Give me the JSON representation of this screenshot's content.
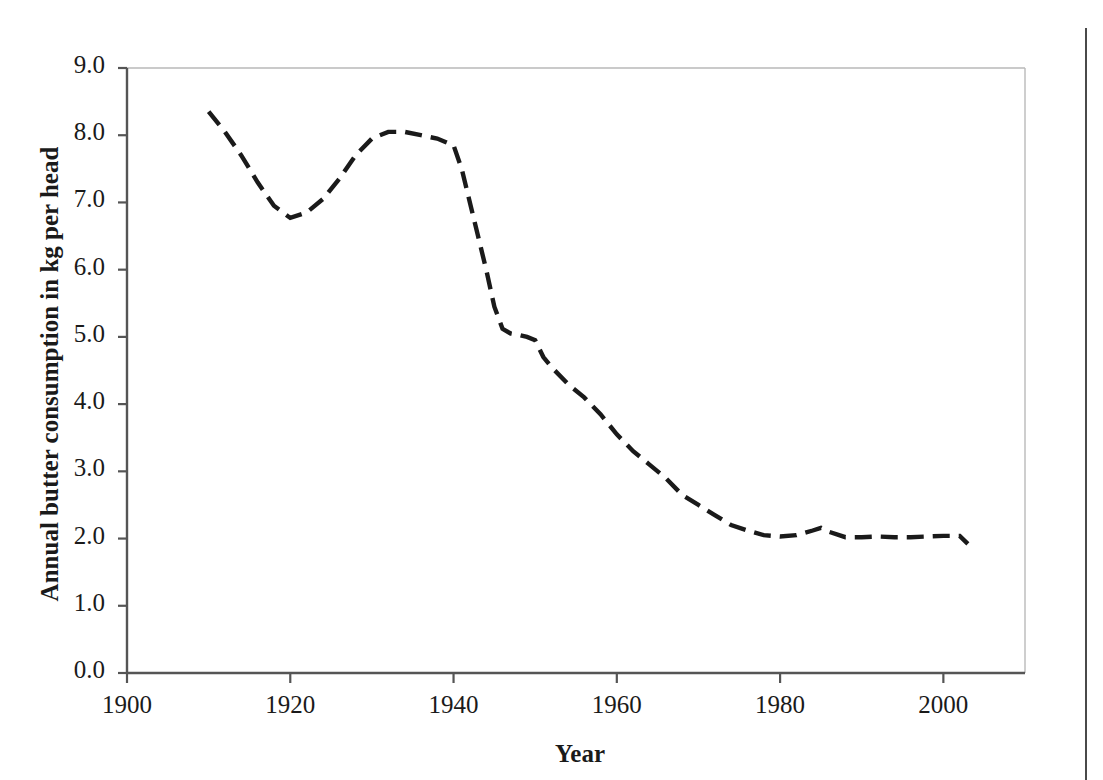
{
  "chart_data": {
    "type": "line",
    "title": "",
    "xlabel": "Year",
    "ylabel": "Annual butter consumption in kg per head",
    "xlim": [
      1900,
      2010
    ],
    "ylim": [
      0.0,
      9.0
    ],
    "grid": false,
    "legend": "none",
    "line_style": "dashed",
    "line_color": "#1a1a1a",
    "x_ticks": [
      1900,
      1920,
      1940,
      1960,
      1980,
      2000
    ],
    "x_tick_labels": [
      "1900",
      "1920",
      "1940",
      "1960",
      "1980",
      "2000"
    ],
    "y_ticks": [
      0.0,
      1.0,
      2.0,
      3.0,
      4.0,
      5.0,
      6.0,
      7.0,
      8.0,
      9.0
    ],
    "y_tick_labels": [
      "0.0",
      "1.0",
      "2.0",
      "3.0",
      "4.0",
      "5.0",
      "6.0",
      "7.0",
      "8.0",
      "9.0"
    ],
    "series": [
      {
        "name": "Annual butter consumption",
        "x": [
          1910,
          1912,
          1914,
          1916,
          1918,
          1920,
          1922,
          1924,
          1926,
          1928,
          1930,
          1932,
          1934,
          1936,
          1938,
          1939,
          1940,
          1941,
          1942,
          1943,
          1944,
          1945,
          1946,
          1947,
          1948,
          1949,
          1950,
          1951,
          1952,
          1954,
          1956,
          1958,
          1960,
          1962,
          1964,
          1966,
          1968,
          1970,
          1972,
          1974,
          1976,
          1978,
          1980,
          1982,
          1984,
          1985,
          1986,
          1988,
          1990,
          1992,
          1994,
          1996,
          1998,
          2000,
          2002,
          2003
        ],
        "y": [
          8.35,
          8.05,
          7.7,
          7.3,
          6.95,
          6.77,
          6.85,
          7.05,
          7.35,
          7.7,
          7.95,
          8.05,
          8.05,
          8.0,
          7.95,
          7.9,
          7.85,
          7.5,
          7.0,
          6.5,
          6.0,
          5.45,
          5.12,
          5.05,
          5.03,
          5.0,
          4.95,
          4.7,
          4.55,
          4.3,
          4.1,
          3.85,
          3.55,
          3.3,
          3.1,
          2.9,
          2.65,
          2.5,
          2.35,
          2.2,
          2.12,
          2.05,
          2.03,
          2.05,
          2.12,
          2.16,
          2.1,
          2.02,
          2.02,
          2.03,
          2.02,
          2.02,
          2.03,
          2.04,
          2.04,
          1.92
        ]
      }
    ]
  },
  "axes": {
    "y_title": "Annual butter consumption in kg per head",
    "x_title": "Year"
  }
}
